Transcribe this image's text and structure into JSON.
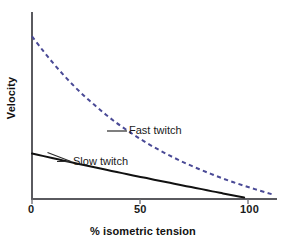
{
  "chart_data": {
    "type": "line",
    "title": "",
    "subtitle": "",
    "xlabel": "% isometric tension",
    "ylabel": "Velocity",
    "xlim": [
      0,
      115
    ],
    "ylim": [
      0,
      1.0
    ],
    "xticks": [
      0,
      50,
      100
    ],
    "xticklabels": [
      "0",
      "50",
      "100"
    ],
    "yticks": [],
    "yticklabels": [],
    "grid": false,
    "legend_position": "inline-annotations",
    "series": [
      {
        "name": "Fast twitch",
        "style": "dashed",
        "color": "#4a4a96",
        "x": [
          0,
          5,
          10,
          15,
          20,
          25,
          30,
          35,
          40,
          45,
          50,
          55,
          60,
          65,
          70,
          75,
          80,
          85,
          90,
          95,
          100,
          105,
          110,
          113
        ],
        "values": [
          0.875,
          0.8,
          0.73,
          0.665,
          0.605,
          0.55,
          0.5,
          0.452,
          0.408,
          0.368,
          0.33,
          0.295,
          0.263,
          0.233,
          0.205,
          0.179,
          0.155,
          0.132,
          0.11,
          0.09,
          0.071,
          0.053,
          0.036,
          0.026
        ]
      },
      {
        "name": "Slow twitch",
        "style": "solid",
        "color": "#111111",
        "x": [
          0,
          5,
          10,
          15,
          20,
          25,
          30,
          35,
          40,
          45,
          50,
          55,
          60,
          65,
          70,
          75,
          80,
          85,
          90,
          95,
          100
        ],
        "values": [
          0.245,
          0.232,
          0.219,
          0.206,
          0.194,
          0.181,
          0.169,
          0.157,
          0.145,
          0.133,
          0.121,
          0.11,
          0.098,
          0.087,
          0.075,
          0.064,
          0.053,
          0.041,
          0.03,
          0.019,
          0.008
        ]
      }
    ],
    "annotations": [
      {
        "text": "Fast twitch",
        "points_to_series": "Fast twitch"
      },
      {
        "text": "Slow twitch",
        "points_to_series": "Slow twitch"
      }
    ],
    "colors": {
      "fast_twitch": "#4a4a96",
      "slow_twitch": "#111111",
      "axis": "#5a5a5f",
      "background": "#ffffff",
      "text": "#1a1a1a"
    }
  },
  "axes": {
    "x_title": "% isometric tension",
    "y_title": "Velocity",
    "x_tick_labels": [
      "0",
      "50",
      "100"
    ]
  },
  "labels": {
    "fast_twitch": "Fast twitch",
    "slow_twitch": "Slow twitch"
  }
}
